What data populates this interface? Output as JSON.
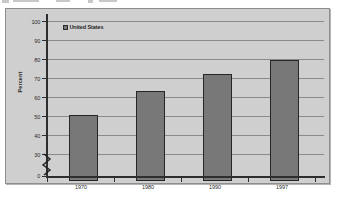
{
  "figure": {
    "background_color": "#cfcfcf",
    "border_color": "#8e8e8e",
    "bar_color": "#787878",
    "bar_border_color": "#262626",
    "gridline_color": "#8a8a8a",
    "axis_color": "#2e2e2e"
  },
  "legend": {
    "position": "top-left-inside",
    "entries": [
      {
        "label": "United States",
        "swatch_icon": "filled-square-icon",
        "color": "#787878"
      }
    ]
  },
  "axis_break": {
    "present": true,
    "icon": "axis-break-zigzag-icon",
    "between": [
      0,
      30
    ]
  },
  "chart_data": {
    "type": "bar",
    "title": "",
    "subtitle": "",
    "xlabel": "",
    "ylabel": "Percent",
    "categories": [
      "1970",
      "1980",
      "1990",
      "1997"
    ],
    "series": [
      {
        "name": "United States",
        "color": "#787878",
        "values": [
          53,
          66,
          75,
          82
        ]
      }
    ],
    "ylim": [
      0,
      100
    ],
    "yticks": [
      0,
      30,
      40,
      50,
      60,
      70,
      80,
      90,
      100
    ],
    "ytick_labels": [
      "0",
      "30",
      "40",
      "50",
      "60",
      "70",
      "80",
      "90",
      "100"
    ],
    "y_axis_broken_between": [
      0,
      30
    ],
    "grid": true,
    "grid_axis": "y",
    "legend_position": "inside top left",
    "annotations": []
  }
}
